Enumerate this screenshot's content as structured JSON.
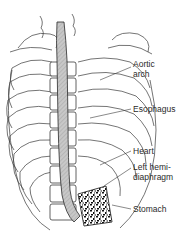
{
  "figure": {
    "labels": [
      {
        "id": "aortic-arch",
        "line1": "Aortic",
        "line2": "arch"
      },
      {
        "id": "esophagus",
        "line1": "Esophagus",
        "line2": ""
      },
      {
        "id": "heart",
        "line1": "Heart",
        "line2": ""
      },
      {
        "id": "left-hemidiaphragm",
        "line1": "Left hemi-",
        "line2": "diaphragm"
      },
      {
        "id": "stomach",
        "line1": "Stomach",
        "line2": ""
      }
    ],
    "colors": {
      "line": "#3a3a3a",
      "esophagus_fill": "#bdbdbd",
      "stomach_fill": "#ffffff",
      "text": "#2a2a2a"
    }
  }
}
